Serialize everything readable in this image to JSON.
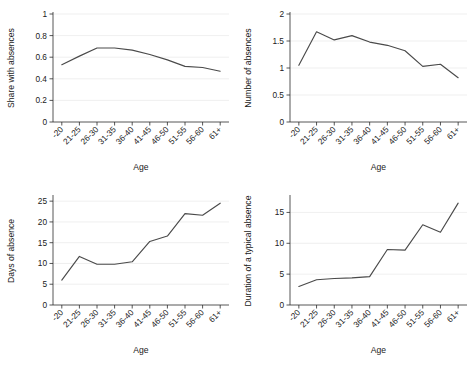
{
  "figure": {
    "background": "#ffffff",
    "line_color": "#4a4a4a",
    "grid_color": "#ebebeb",
    "axis_color": "#2b2b2b",
    "panel_count": 4
  },
  "chart_data": [
    {
      "id": "share-with-absences",
      "type": "line",
      "title": "",
      "xlabel": "Age",
      "ylabel": "Share with absences",
      "categories": [
        "-20",
        "21-25",
        "26-30",
        "31-35",
        "36-40",
        "41-45",
        "46-50",
        "51-55",
        "56-60",
        "61+"
      ],
      "values": [
        0.53,
        0.61,
        0.685,
        0.685,
        0.665,
        0.625,
        0.575,
        0.515,
        0.505,
        0.47
      ],
      "yticks": [
        0,
        0.2,
        0.4,
        0.6,
        0.8,
        1
      ],
      "ytick_labels": [
        "0",
        "0.2",
        "0.4",
        "0.6",
        "0.8",
        "1"
      ],
      "ylim": [
        0,
        1
      ],
      "grid": true,
      "legend": "none"
    },
    {
      "id": "number-of-absences",
      "type": "line",
      "title": "",
      "xlabel": "Age",
      "ylabel": "Number of absences",
      "categories": [
        "-20",
        "21-25",
        "26-30",
        "31-35",
        "36-40",
        "41-45",
        "46-50",
        "51-55",
        "56-60",
        "61+"
      ],
      "values": [
        1.05,
        1.67,
        1.52,
        1.6,
        1.48,
        1.42,
        1.32,
        1.03,
        1.07,
        0.82
      ],
      "yticks": [
        0,
        0.5,
        1,
        1.5,
        2
      ],
      "ytick_labels": [
        "0",
        "0.5",
        "1",
        "1.5",
        "2"
      ],
      "ylim": [
        0,
        2
      ],
      "grid": true,
      "legend": "none"
    },
    {
      "id": "days-of-absence",
      "type": "line",
      "title": "",
      "xlabel": "Age",
      "ylabel": "Days of absence",
      "categories": [
        "-20",
        "21-25",
        "26-30",
        "31-35",
        "36-40",
        "41-45",
        "46-50",
        "51-55",
        "56-60",
        "61+"
      ],
      "values": [
        6.0,
        11.7,
        9.8,
        9.8,
        10.4,
        15.3,
        16.6,
        22.0,
        21.6,
        24.5
      ],
      "yticks": [
        0,
        5,
        10,
        15,
        20,
        25
      ],
      "ytick_labels": [
        "0",
        "5",
        "10",
        "15",
        "20",
        "25"
      ],
      "ylim": [
        0,
        26
      ],
      "grid": true,
      "legend": "none"
    },
    {
      "id": "duration-of-typical-absence",
      "type": "line",
      "title": "",
      "xlabel": "Age",
      "ylabel": "Duration of a typical absence",
      "categories": [
        "-20",
        "21-25",
        "26-30",
        "31-35",
        "36-40",
        "41-45",
        "46-50",
        "51-55",
        "56-60",
        "61+"
      ],
      "values": [
        3.0,
        4.1,
        4.3,
        4.4,
        4.6,
        9.0,
        8.9,
        13.0,
        11.8,
        16.5
      ],
      "yticks": [
        0,
        5,
        10,
        15
      ],
      "ytick_labels": [
        "0",
        "5",
        "10",
        "15"
      ],
      "ylim": [
        0,
        17.5
      ],
      "grid": true,
      "legend": "none"
    }
  ]
}
